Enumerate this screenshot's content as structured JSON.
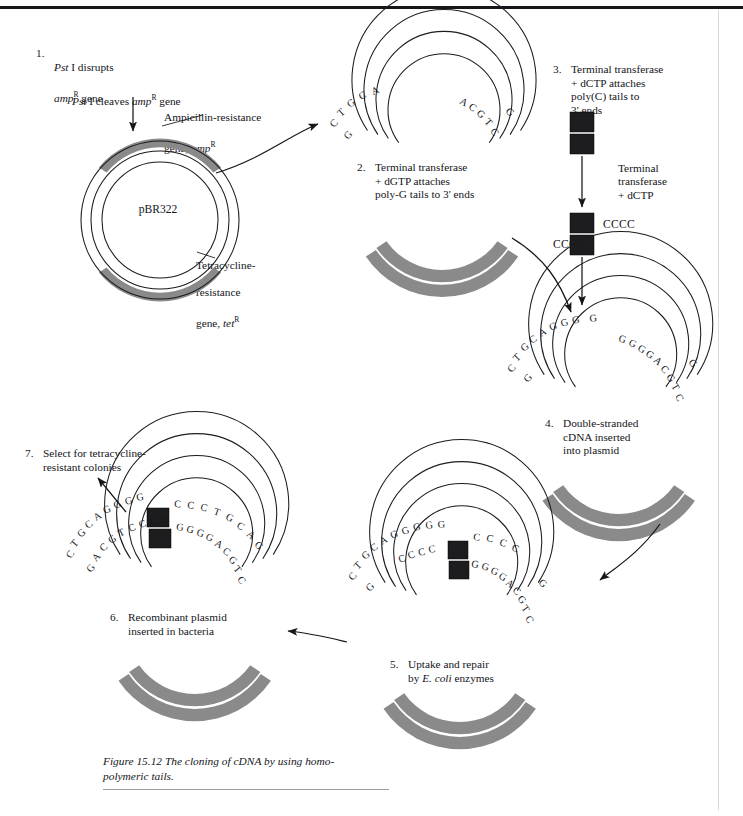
{
  "figure": {
    "caption_line1": "Figure 15.12  The cloning of cDNA by using homo-",
    "caption_line2": "polymeric tails."
  },
  "steps": [
    {
      "number": "1.",
      "line1_pre": "Pst",
      "line1_post": " I disrupts",
      "line2_pre": "amp",
      "line2_sup": "R",
      "line2_post": " gene"
    },
    {
      "number": "2.",
      "text": "Terminal transferase\n+ dGTP attaches\npoly-G tails to 3' ends"
    },
    {
      "number": "3.",
      "text": "Terminal transferase\n+ dCTP attaches\npoly(C) tails to\n3' ends"
    },
    {
      "number": "4.",
      "text": "Double-stranded\ncDNA inserted\ninto plasmid"
    },
    {
      "number": "5.",
      "pre": "Uptake and repair\nby ",
      "italic": "E. coli",
      "post": " enzymes"
    },
    {
      "number": "6.",
      "text": "Recombinant plasmid\ninserted in bacteria"
    },
    {
      "number": "7.",
      "text": "Select for tetracycline-\nresistant colonies"
    }
  ],
  "labels": {
    "cleaves_pre": "Pst",
    "cleaves_mid": " I cleaves ",
    "cleaves_gene": "amp",
    "cleaves_sup": "R",
    "cleaves_post": " gene",
    "amp_l1": "Ampicillin-resistance",
    "amp_l2_pre": "gene, ",
    "amp_l2_it": "amp",
    "amp_l2_sup": "R",
    "plasmid_name": "pBR322",
    "tet_l1": "Tetracycline-",
    "tet_l2": "resistance",
    "tet_l3_pre": "gene, ",
    "tet_l3_it": "tet",
    "tet_l3_sup": "R",
    "tt_dctp": "Terminal\ntransferase\n+ dCTP",
    "cccc_right": "CCCC",
    "cccc_left": "CCCC"
  },
  "sequences": {
    "step2_outer_left": "CTGCA",
    "step2_inner_left": "G",
    "step2_outer_right": "ACGTC",
    "step2_inner_right": "G",
    "step4_outer_left": "CTGCAGGG",
    "step4_outer_left_tail": "G",
    "step4_inner_left": "G",
    "step4_outer_right": "GGGGACGTC",
    "step4_inner_right": "G",
    "step5_outer_left": "CTGCAGGGG",
    "step5_inner_left_tail": "CCCC",
    "step5_outer_right_tail": "C C C C",
    "step5_inner_right": "GGGGACGTC",
    "step5_far_left_outer": "CTGCA",
    "step5_far_left_inner": "G",
    "step5_far_right_outer": "ACGTC",
    "step5_far_right_inner": "G",
    "step6_outer_left": "CTGCAGGGG",
    "step6_inner_left": "GACGTCCCC",
    "step6_outer_right": "C C C T G C A G",
    "step6_inner_right": "GGGGACGTC"
  },
  "colors": {
    "gene_shade": "#8a8a8a",
    "cdna_block": "#1d1d1f",
    "ink": "#14151a",
    "paper": "#ffffff"
  }
}
